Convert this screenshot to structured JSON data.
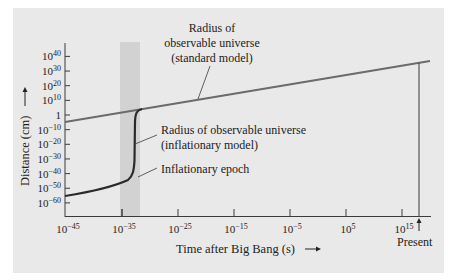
{
  "chart_data": {
    "type": "line",
    "title": "",
    "xlabel": "Time after Big Bang (s)",
    "ylabel": "Distance (cm)",
    "x_scale": "log10",
    "y_scale": "log10",
    "xlim_exponent": [
      -45,
      18
    ],
    "ylim_exponent": [
      -65,
      45
    ],
    "grid": false,
    "x_ticks": [
      {
        "base": "10",
        "exp": "−45",
        "value": -45
      },
      {
        "base": "10",
        "exp": "−35",
        "value": -35
      },
      {
        "base": "10",
        "exp": "−25",
        "value": -25
      },
      {
        "base": "10",
        "exp": "−15",
        "value": -15
      },
      {
        "base": "10",
        "exp": "−5",
        "value": -5
      },
      {
        "base": "10",
        "exp": "5",
        "value": 5
      },
      {
        "base": "10",
        "exp": "15",
        "value": 15
      }
    ],
    "y_ticks": [
      {
        "base": "10",
        "exp": "40",
        "value": 40
      },
      {
        "base": "10",
        "exp": "30",
        "value": 30
      },
      {
        "base": "10",
        "exp": "20",
        "value": 20
      },
      {
        "base": "10",
        "exp": "10",
        "value": 10
      },
      {
        "base": "1",
        "exp": "",
        "value": 0
      },
      {
        "base": "10",
        "exp": "−10",
        "value": -10
      },
      {
        "base": "10",
        "exp": "−20",
        "value": -20
      },
      {
        "base": "10",
        "exp": "−30",
        "value": -30
      },
      {
        "base": "10",
        "exp": "−40",
        "value": -40
      },
      {
        "base": "10",
        "exp": "−50",
        "value": -50
      },
      {
        "base": "10",
        "exp": "−60",
        "value": -60
      }
    ],
    "series": [
      {
        "name": "Radius of observable universe (standard model)",
        "x_log10": [
          -45,
          17.5
        ],
        "y_log10": [
          -5,
          37
        ]
      },
      {
        "name": "Radius of observable universe (inflationary model)",
        "x_log10": [
          -45,
          -40,
          -37,
          -35,
          -34.2,
          -33.8,
          -33.5,
          -33.0,
          -32
        ],
        "y_log10": [
          -56,
          -53,
          -50.5,
          -47,
          -40,
          -10,
          0,
          2,
          2.7
        ]
      }
    ],
    "shaded_regions": [
      {
        "name": "Inflationary epoch",
        "x_log10_start": -35,
        "x_log10_end": -31.6
      }
    ],
    "annotations": [
      {
        "text": "Radius of observable universe (standard model)",
        "points_to": "standard model line"
      },
      {
        "text": "Radius of observable universe (inflationary model)",
        "points_to": "inflationary curve"
      },
      {
        "text": "Inflationary epoch",
        "points_to": "shaded band"
      },
      {
        "text": "Present",
        "points_to": "vertical line at ~10^17.5 s"
      }
    ]
  },
  "labels": {
    "standard_line1": "Radius of",
    "standard_line2": "observable universe",
    "standard_line3": "(standard model)",
    "inflation_line1": "Radius of observable universe",
    "inflation_line2": "(inflationary model)",
    "epoch": "Inflationary epoch",
    "present": "Present",
    "xlabel": "Time after Big Bang (s)",
    "ylabel": "Distance (cm)"
  },
  "colors": {
    "panel": "#e9e9e9",
    "epoch_band": "#d2d2d2",
    "standard_line": "#6b6b6b",
    "inflation_line": "#2a2a2a",
    "axis": "#3a3a3a"
  }
}
